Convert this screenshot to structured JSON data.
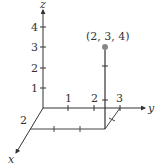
{
  "diagram": {
    "type": "3d-coordinate-plot",
    "axes": {
      "x": {
        "label": "x",
        "ticks": [
          "2"
        ]
      },
      "y": {
        "label": "y",
        "ticks": [
          "1",
          "2",
          "3"
        ]
      },
      "z": {
        "label": "z",
        "ticks": [
          "1",
          "2",
          "3",
          "4"
        ]
      }
    },
    "point": {
      "label": "(2, 3, 4)",
      "coords": [
        2,
        3,
        4
      ],
      "color": "#888888"
    },
    "colors": {
      "axis": "#333333",
      "guide": "#444444"
    }
  }
}
